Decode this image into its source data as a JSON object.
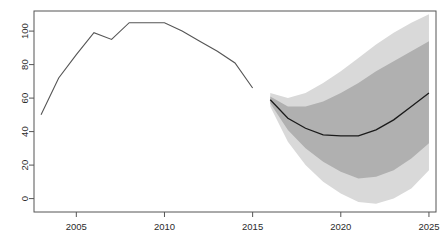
{
  "chart_data": {
    "type": "line",
    "title": "",
    "subtitle": "",
    "xlabel": "",
    "ylabel": "",
    "xlim": [
      2002.6,
      2025.4
    ],
    "ylim": [
      -8,
      112
    ],
    "grid": false,
    "legend": false,
    "legend_position": "none",
    "xticks": [
      2005,
      2010,
      2015,
      2020,
      2025
    ],
    "xtick_labels": [
      "2005",
      "2010",
      "2015",
      "2020",
      "2025"
    ],
    "yticks": [
      0,
      20,
      40,
      60,
      80,
      100
    ],
    "ytick_labels": [
      "0",
      "20",
      "40",
      "60",
      "80",
      "100"
    ],
    "colors": {
      "history_line": "#555555",
      "forecast_line": "#1a1a1a",
      "band_outer": "#d9d9d9",
      "band_inner": "#b0b0b0",
      "axis": "#555555",
      "background": "#ffffff"
    },
    "series": [
      {
        "name": "history",
        "type": "line",
        "x": [
          2003,
          2004,
          2005,
          2006,
          2007,
          2008,
          2009,
          2010,
          2011,
          2012,
          2013,
          2014,
          2015
        ],
        "values": [
          50,
          72,
          86,
          99,
          95,
          105,
          105,
          105,
          100,
          94,
          88,
          81,
          66
        ]
      },
      {
        "name": "forecast-median",
        "type": "line",
        "x": [
          2016,
          2017,
          2018,
          2019,
          2020,
          2021,
          2022,
          2023,
          2024,
          2025
        ],
        "values": [
          59,
          48,
          42,
          38,
          37.5,
          37.5,
          41,
          47,
          55,
          63
        ]
      }
    ],
    "bands": [
      {
        "name": "outer-interval",
        "x": [
          2016,
          2017,
          2018,
          2019,
          2020,
          2021,
          2022,
          2023,
          2024,
          2025
        ],
        "upper": [
          63,
          60,
          63,
          69,
          76,
          84,
          92,
          99,
          105,
          110
        ],
        "lower": [
          55,
          34,
          20,
          10,
          3,
          -2,
          -3,
          0,
          6,
          17
        ]
      },
      {
        "name": "inner-interval",
        "x": [
          2016,
          2017,
          2018,
          2019,
          2020,
          2021,
          2022,
          2023,
          2024,
          2025
        ],
        "upper": [
          61,
          55,
          55,
          58,
          63,
          69,
          76,
          82,
          88,
          94
        ],
        "lower": [
          57,
          41,
          30,
          22,
          16,
          12,
          13,
          17,
          24,
          33
        ]
      }
    ]
  }
}
